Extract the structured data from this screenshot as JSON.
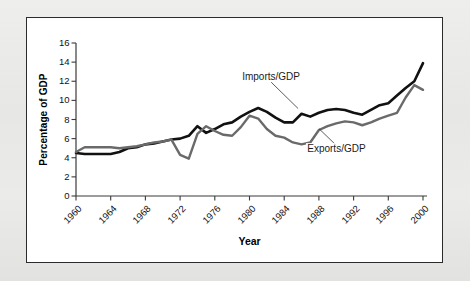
{
  "figure": {
    "panel_bg": "#ffffff",
    "page_bg": "#e9e9e7",
    "border_color": "#2b2b2b"
  },
  "chart_data": {
    "type": "line",
    "title": "",
    "xlabel": "Year",
    "ylabel": "Percentage of GDP",
    "xlim": [
      1960,
      2000
    ],
    "ylim": [
      0,
      16
    ],
    "xticks": [
      1960,
      1964,
      1968,
      1972,
      1976,
      1980,
      1984,
      1988,
      1992,
      1996,
      2000
    ],
    "yticks": [
      0,
      2,
      4,
      6,
      8,
      10,
      12,
      14,
      16
    ],
    "grid": false,
    "legend_position": "inline-annotations",
    "x": [
      1960,
      1961,
      1962,
      1963,
      1964,
      1965,
      1966,
      1967,
      1968,
      1969,
      1970,
      1971,
      1972,
      1973,
      1974,
      1975,
      1976,
      1977,
      1978,
      1979,
      1980,
      1981,
      1982,
      1983,
      1984,
      1985,
      1986,
      1987,
      1988,
      1989,
      1990,
      1991,
      1992,
      1993,
      1994,
      1995,
      1996,
      1997,
      1998,
      1999,
      2000
    ],
    "series": [
      {
        "name": "Imports/GDP",
        "color": "#111111",
        "values": [
          4.5,
          4.4,
          4.4,
          4.4,
          4.4,
          4.6,
          5.0,
          5.1,
          5.4,
          5.5,
          5.7,
          5.9,
          6.0,
          6.3,
          7.3,
          6.6,
          7.0,
          7.5,
          7.7,
          8.3,
          8.8,
          9.2,
          8.8,
          8.2,
          7.7,
          7.7,
          8.6,
          8.3,
          8.7,
          9.0,
          9.1,
          9.0,
          8.7,
          8.5,
          9.0,
          9.5,
          9.7,
          10.5,
          11.3,
          12.0,
          13.9
        ]
      },
      {
        "name": "Exports/GDP",
        "color": "#6a6a6a",
        "values": [
          4.6,
          5.1,
          5.1,
          5.1,
          5.1,
          5.0,
          5.1,
          5.2,
          5.4,
          5.6,
          5.7,
          5.9,
          4.3,
          3.9,
          6.5,
          7.3,
          6.8,
          6.4,
          6.3,
          7.2,
          8.4,
          8.1,
          7.0,
          6.3,
          6.1,
          5.6,
          5.4,
          5.6,
          6.9,
          7.3,
          7.6,
          7.8,
          7.7,
          7.4,
          7.7,
          8.1,
          8.4,
          8.7,
          10.3,
          11.6,
          11.1
        ]
      }
    ],
    "annotations": [
      {
        "text": "Imports/GDP",
        "x": 1982.5,
        "y": 12.3
      },
      {
        "text": "Exports/GDP",
        "x": 1990.0,
        "y": 4.8
      }
    ]
  }
}
